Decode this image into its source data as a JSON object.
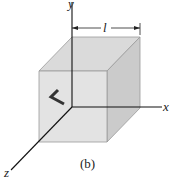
{
  "figure": {
    "caption": "(b)",
    "dimension_label": "l",
    "axes": {
      "x": "x",
      "y": "y",
      "z": "z"
    },
    "colors": {
      "front_face": "#e2e2e2",
      "top_face": "#d9d9d9",
      "side_face": "#c9c9c9",
      "edges": "#8a8a8a",
      "axes": "#111111",
      "arrow": "#333333"
    }
  }
}
